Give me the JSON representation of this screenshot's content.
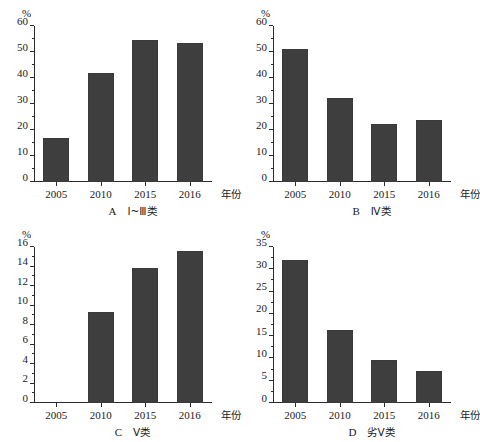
{
  "figure": {
    "type": "multi-panel-bar-chart",
    "panel_count": 4,
    "bar_color": "#3e3e3e",
    "axis_color": "#2b2b2b",
    "background": "#ffffff"
  },
  "panels": [
    {
      "key": "A",
      "caption_letter": "A",
      "caption_cjk": "Ⅰ~Ⅲ类",
      "caption_full": "A  Ⅰ~Ⅲ类",
      "unit": "%",
      "xaxis_title": "年份",
      "categories": [
        "2005",
        "2010",
        "2015",
        "2016"
      ],
      "values": [
        17,
        42,
        54.5,
        53.5
      ],
      "yticks": [
        "0",
        "10",
        "20",
        "30",
        "40",
        "50",
        "60"
      ],
      "ymin": 0,
      "ymax": 60
    },
    {
      "key": "B",
      "caption_letter": "B",
      "caption_cjk": "Ⅳ类",
      "caption_full": "B  Ⅳ类",
      "unit": "%",
      "xaxis_title": "年份",
      "categories": [
        "2005",
        "2010",
        "2015",
        "2016"
      ],
      "values": [
        51,
        32.5,
        22.5,
        24
      ],
      "yticks": [
        "0",
        "10",
        "20",
        "30",
        "40",
        "50",
        "60"
      ],
      "ymin": 0,
      "ymax": 60
    },
    {
      "key": "C",
      "caption_letter": "C",
      "caption_cjk": "Ⅴ类",
      "caption_full": "C  Ⅴ类",
      "unit": "%",
      "xaxis_title": "年份",
      "categories": [
        "2005",
        "2010",
        "2015",
        "2016"
      ],
      "values": [
        0,
        9.3,
        13.8,
        15.6
      ],
      "yticks": [
        "0",
        "2",
        "4",
        "6",
        "8",
        "10",
        "12",
        "14",
        "16"
      ],
      "ymin": 0,
      "ymax": 16
    },
    {
      "key": "D",
      "caption_letter": "D",
      "caption_cjk": "劣Ⅴ类",
      "caption_full": "D  劣Ⅴ类",
      "unit": "%",
      "xaxis_title": "年份",
      "categories": [
        "2005",
        "2010",
        "2015",
        "2016"
      ],
      "values": [
        32,
        16.3,
        9.6,
        7.2
      ],
      "yticks": [
        "0",
        "5",
        "10",
        "15",
        "20",
        "25",
        "30",
        "35"
      ],
      "ymin": 0,
      "ymax": 35
    }
  ],
  "chart_data": [
    {
      "type": "bar",
      "title": "A  Ⅰ~Ⅲ类",
      "xlabel": "年份",
      "ylabel": "%",
      "categories": [
        "2005",
        "2010",
        "2015",
        "2016"
      ],
      "values": [
        17,
        42,
        54.5,
        53.5
      ],
      "ylim": [
        0,
        60
      ],
      "ytick_step": 10,
      "grid": false,
      "legend": "none"
    },
    {
      "type": "bar",
      "title": "B  Ⅳ类",
      "xlabel": "年份",
      "ylabel": "%",
      "categories": [
        "2005",
        "2010",
        "2015",
        "2016"
      ],
      "values": [
        51,
        32.5,
        22.5,
        24
      ],
      "ylim": [
        0,
        60
      ],
      "ytick_step": 10,
      "grid": false,
      "legend": "none"
    },
    {
      "type": "bar",
      "title": "C  Ⅴ类",
      "xlabel": "年份",
      "ylabel": "%",
      "categories": [
        "2005",
        "2010",
        "2015",
        "2016"
      ],
      "values": [
        0,
        9.3,
        13.8,
        15.6
      ],
      "ylim": [
        0,
        16
      ],
      "ytick_step": 2,
      "grid": false,
      "legend": "none"
    },
    {
      "type": "bar",
      "title": "D  劣Ⅴ类",
      "xlabel": "年份",
      "ylabel": "%",
      "categories": [
        "2005",
        "2010",
        "2015",
        "2016"
      ],
      "values": [
        32,
        16.3,
        9.6,
        7.2
      ],
      "ylim": [
        0,
        35
      ],
      "ytick_step": 5,
      "grid": false,
      "legend": "none"
    }
  ]
}
